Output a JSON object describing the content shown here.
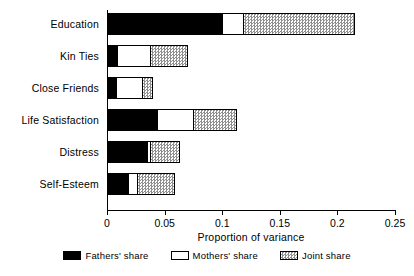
{
  "chart_data": {
    "type": "bar",
    "orientation": "horizontal",
    "stacked": true,
    "title": "",
    "xlabel": "Proportion of variance",
    "ylabel": "",
    "xlim": [
      0,
      0.25
    ],
    "xticks": [
      "0",
      "0.05",
      "0.1",
      "0.15",
      "0.2",
      "0.25"
    ],
    "xtick_values": [
      0,
      0.05,
      0.1,
      0.15,
      0.2,
      0.25
    ],
    "grid": false,
    "legend_position": "bottom",
    "categories": [
      "Education",
      "Kin Ties",
      "Close Friends",
      "Life Satisfaction",
      "Distress",
      "Self-Esteem"
    ],
    "series": [
      {
        "name": "Fathers' share",
        "color": "#000000",
        "values": [
          0.1,
          0.009,
          0.008,
          0.043,
          0.035,
          0.018
        ]
      },
      {
        "name": "Mothers' share",
        "color": "#ffffff",
        "values": [
          0.018,
          0.028,
          0.022,
          0.032,
          0.002,
          0.008
        ]
      },
      {
        "name": "Joint share",
        "color": "#a0a0a0",
        "values": [
          0.097,
          0.033,
          0.01,
          0.038,
          0.026,
          0.033
        ]
      }
    ],
    "totals": [
      0.215,
      0.07,
      0.04,
      0.113,
      0.063,
      0.059
    ]
  },
  "legend": {
    "items": [
      {
        "label": "Fathers' share",
        "swatch": "black-filled-swatch"
      },
      {
        "label": "Mothers' share",
        "swatch": "white-open-swatch"
      },
      {
        "label": "Joint share",
        "swatch": "gray-hatched-swatch"
      }
    ]
  }
}
